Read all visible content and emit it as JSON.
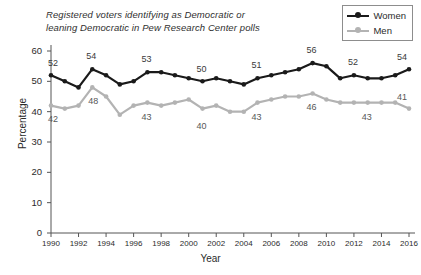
{
  "title": {
    "line1": "Registered voters identifying as Democratic or",
    "line2": "leaning Democratic in Pew Research Center polls"
  },
  "legend": {
    "position": "top-right",
    "items": [
      {
        "label": "Women",
        "color": "#1a1a1a"
      },
      {
        "label": "Men",
        "color": "#b3b3b3"
      }
    ]
  },
  "axes": {
    "xlabel": "Year",
    "ylabel": "Percentage",
    "yticks": [
      "0",
      "10",
      "20",
      "30",
      "40",
      "50",
      "60"
    ],
    "xticks": [
      "1990",
      "1992",
      "1994",
      "1996",
      "1998",
      "2000",
      "2002",
      "2004",
      "2006",
      "2008",
      "2010",
      "2012",
      "2014",
      "2016"
    ]
  },
  "point_labels": [
    {
      "text": "52",
      "series": "Women",
      "x": 1990,
      "value": 52
    },
    {
      "text": "54",
      "series": "Women",
      "x": 1993,
      "value": 54
    },
    {
      "text": "53",
      "series": "Women",
      "x": 1997,
      "value": 53
    },
    {
      "text": "50",
      "series": "Women",
      "x": 2001,
      "value": 50
    },
    {
      "text": "51",
      "series": "Women",
      "x": 2005,
      "value": 51
    },
    {
      "text": "56",
      "series": "Women",
      "x": 2009,
      "value": 56
    },
    {
      "text": "52",
      "series": "Women",
      "x": 2012,
      "value": 52
    },
    {
      "text": "54",
      "series": "Women",
      "x": 2016,
      "value": 54
    },
    {
      "text": "42",
      "series": "Men",
      "x": 1990,
      "value": 42
    },
    {
      "text": "48",
      "series": "Men",
      "x": 1993,
      "value": 48
    },
    {
      "text": "43",
      "series": "Men",
      "x": 1997,
      "value": 43
    },
    {
      "text": "40",
      "series": "Men",
      "x": 2001,
      "value": 40
    },
    {
      "text": "43",
      "series": "Men",
      "x": 2005,
      "value": 43
    },
    {
      "text": "46",
      "series": "Men",
      "x": 2009,
      "value": 46
    },
    {
      "text": "43",
      "series": "Men",
      "x": 2013,
      "value": 43
    },
    {
      "text": "41",
      "series": "Men",
      "x": 2016,
      "value": 41
    }
  ],
  "chart_data": {
    "type": "line",
    "title": "Registered voters identifying as Democratic or leaning Democratic in Pew Research Center polls",
    "xlabel": "Year",
    "ylabel": "Percentage",
    "xlim": [
      1990,
      2016
    ],
    "ylim": [
      0,
      60
    ],
    "ytick_step": 10,
    "xtick_step": 2,
    "grid": false,
    "legend_position": "top-right",
    "x": [
      1990,
      1991,
      1992,
      1993,
      1994,
      1995,
      1996,
      1997,
      1998,
      1999,
      2000,
      2001,
      2002,
      2003,
      2004,
      2005,
      2006,
      2007,
      2008,
      2009,
      2010,
      2011,
      2012,
      2013,
      2014,
      2015,
      2016
    ],
    "series": [
      {
        "name": "Women",
        "color": "#1a1a1a",
        "values": [
          52,
          50,
          48,
          54,
          52,
          49,
          50,
          53,
          53,
          52,
          51,
          50,
          51,
          50,
          49,
          51,
          52,
          53,
          54,
          56,
          55,
          51,
          52,
          51,
          51,
          52,
          54
        ]
      },
      {
        "name": "Men",
        "color": "#b3b3b3",
        "values": [
          42,
          41,
          42,
          48,
          45,
          39,
          42,
          43,
          42,
          43,
          44,
          41,
          42,
          40,
          40,
          43,
          44,
          45,
          45,
          46,
          44,
          43,
          43,
          43,
          43,
          43,
          41
        ]
      }
    ]
  }
}
